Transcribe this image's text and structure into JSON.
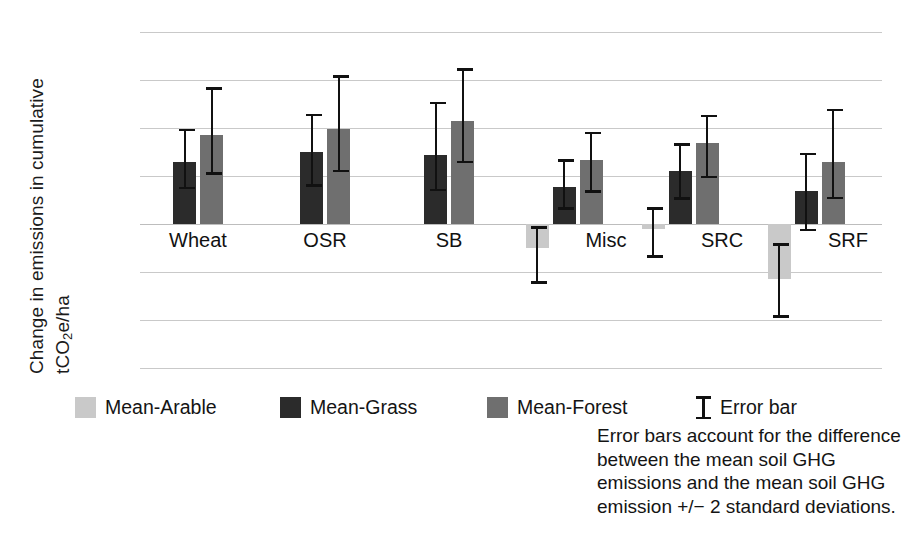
{
  "chart_data": {
    "type": "bar",
    "title": "",
    "xlabel": "",
    "ylabel": "Change in emissions in cumulative tCO2e/ha",
    "ylabel_line1": "Change in emissions in cumulative",
    "ylabel_line2_pre": "tCO",
    "ylabel_line2_sub": "2",
    "ylabel_line2_post": "e/ha",
    "ylim": [
      -300,
      400
    ],
    "yticks": [
      400,
      300,
      200,
      100,
      0,
      -100,
      -200,
      -300
    ],
    "ytick_labels": [
      "400",
      "300",
      "200",
      "100",
      "0",
      "−100",
      "−200",
      "−300"
    ],
    "grid": true,
    "legend_position": "bottom",
    "categories": [
      "Wheat",
      "OSR",
      "SB",
      "Misc",
      "SRC",
      "SRF"
    ],
    "series": [
      {
        "name": "Mean-Arable",
        "color": "#c9c9c9",
        "values": [
          null,
          null,
          null,
          -50,
          -10,
          -115
        ],
        "err_low": [
          null,
          null,
          null,
          -125,
          -70,
          -195
        ],
        "err_high": [
          null,
          null,
          null,
          -5,
          35,
          -40
        ]
      },
      {
        "name": "Mean-Grass",
        "color": "#2b2b2b",
        "values": [
          130,
          150,
          143,
          78,
          110,
          68
        ],
        "err_low": [
          72,
          78,
          68,
          30,
          50,
          -15
        ],
        "err_high": [
          198,
          230,
          255,
          135,
          168,
          148
        ]
      },
      {
        "name": "Mean-Forest",
        "color": "#6f6f6f",
        "values": [
          185,
          198,
          215,
          133,
          168,
          130
        ],
        "err_low": [
          103,
          108,
          127,
          65,
          95,
          52
        ],
        "err_high": [
          285,
          310,
          325,
          192,
          228,
          240
        ]
      }
    ]
  },
  "legend": {
    "items": [
      {
        "label": "Mean-Arable",
        "swatch": "arable",
        "icon": "square-swatch-icon"
      },
      {
        "label": "Mean-Grass",
        "swatch": "grass",
        "icon": "square-swatch-icon"
      },
      {
        "label": "Mean-Forest",
        "swatch": "forest",
        "icon": "square-swatch-icon"
      },
      {
        "label": "Error bar",
        "swatch": "errorbar",
        "icon": "error-bar-icon"
      }
    ]
  },
  "caption": {
    "lines": [
      "Error bars account for the difference",
      "between the mean soil GHG",
      "emissions and the mean soil GHG",
      "emission +/− 2 standard deviations."
    ]
  }
}
